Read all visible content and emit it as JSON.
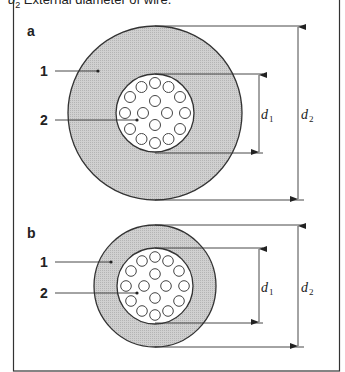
{
  "caption": {
    "symbol": "d",
    "subscript": "2",
    "text": " External diameter of wire."
  },
  "panels": [
    {
      "id": "a",
      "label": "a",
      "callouts": [
        {
          "number": "1",
          "target": "insulation"
        },
        {
          "number": "2",
          "target": "conductor strands"
        }
      ],
      "dimensions": [
        {
          "symbol": "d",
          "subscript": "1"
        },
        {
          "symbol": "d",
          "subscript": "2"
        }
      ],
      "strand_count": 16
    },
    {
      "id": "b",
      "label": "b",
      "callouts": [
        {
          "number": "1",
          "target": "insulation"
        },
        {
          "number": "2",
          "target": "conductor strands"
        }
      ],
      "dimensions": [
        {
          "symbol": "d",
          "subscript": "1"
        },
        {
          "symbol": "d",
          "subscript": "2"
        }
      ],
      "strand_count": 16
    }
  ],
  "colors": {
    "insulation_fill": "#c8c8c8",
    "line": "#333333",
    "background": "#ffffff"
  }
}
